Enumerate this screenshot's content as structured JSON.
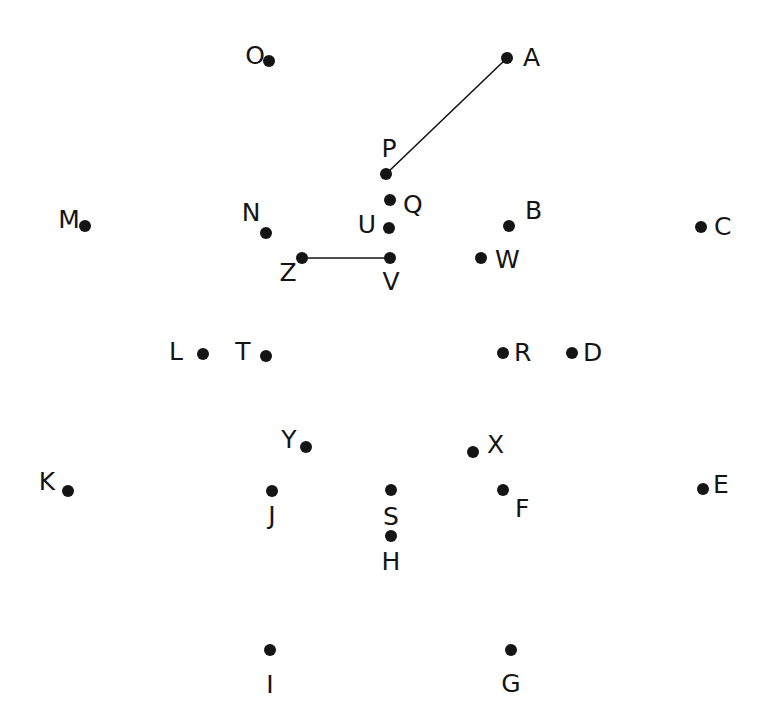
{
  "figure": {
    "type": "node-link-diagram",
    "width": 771,
    "height": 727,
    "background_color": "#ffffff",
    "ink_color": "#141414",
    "dot_radius": 6,
    "label_font_size": 25,
    "edge_stroke_width": 1.6
  },
  "nodes": [
    {
      "id": "A",
      "label": "A",
      "x": 507,
      "y": 58,
      "label_x": 523,
      "label_y": 66,
      "label_anchor": "start"
    },
    {
      "id": "O",
      "label": "O",
      "x": 269,
      "y": 61,
      "label_x": 255,
      "label_y": 64,
      "label_anchor": "middle"
    },
    {
      "id": "P",
      "label": "P",
      "x": 386,
      "y": 174,
      "label_x": 389,
      "label_y": 157,
      "label_anchor": "middle"
    },
    {
      "id": "Q",
      "label": "Q",
      "x": 390,
      "y": 200,
      "label_x": 403,
      "label_y": 213,
      "label_anchor": "start"
    },
    {
      "id": "M",
      "label": "M",
      "x": 85,
      "y": 226,
      "label_x": 69,
      "label_y": 228,
      "label_anchor": "middle"
    },
    {
      "id": "N",
      "label": "N",
      "x": 266,
      "y": 233,
      "label_x": 251,
      "label_y": 221,
      "label_anchor": "middle"
    },
    {
      "id": "U",
      "label": "U",
      "x": 389,
      "y": 228,
      "label_x": 376,
      "label_y": 233,
      "label_anchor": "end"
    },
    {
      "id": "B",
      "label": "B",
      "x": 509,
      "y": 226,
      "label_x": 525,
      "label_y": 219,
      "label_anchor": "start"
    },
    {
      "id": "C",
      "label": "C",
      "x": 701,
      "y": 227,
      "label_x": 714,
      "label_y": 235,
      "label_anchor": "start"
    },
    {
      "id": "W",
      "label": "W",
      "x": 481,
      "y": 258,
      "label_x": 495,
      "label_y": 268,
      "label_anchor": "start"
    },
    {
      "id": "Z",
      "label": "Z",
      "x": 302,
      "y": 258,
      "label_x": 288,
      "label_y": 281,
      "label_anchor": "middle"
    },
    {
      "id": "V",
      "label": "V",
      "x": 390,
      "y": 258,
      "label_x": 391,
      "label_y": 290,
      "label_anchor": "middle"
    },
    {
      "id": "L",
      "label": "L",
      "x": 203,
      "y": 354,
      "label_x": 176,
      "label_y": 360,
      "label_anchor": "middle"
    },
    {
      "id": "T",
      "label": "T",
      "x": 266,
      "y": 356,
      "label_x": 243,
      "label_y": 360,
      "label_anchor": "middle"
    },
    {
      "id": "R",
      "label": "R",
      "x": 503,
      "y": 353,
      "label_x": 514,
      "label_y": 361,
      "label_anchor": "start"
    },
    {
      "id": "D",
      "label": "D",
      "x": 572,
      "y": 353,
      "label_x": 583,
      "label_y": 361,
      "label_anchor": "start"
    },
    {
      "id": "Y",
      "label": "Y",
      "x": 306,
      "y": 447,
      "label_x": 289,
      "label_y": 448,
      "label_anchor": "middle"
    },
    {
      "id": "X",
      "label": "X",
      "x": 473,
      "y": 452,
      "label_x": 487,
      "label_y": 453,
      "label_anchor": "start"
    },
    {
      "id": "K",
      "label": "K",
      "x": 68,
      "y": 491,
      "label_x": 47,
      "label_y": 490,
      "label_anchor": "middle"
    },
    {
      "id": "E",
      "label": "E",
      "x": 703,
      "y": 489,
      "label_x": 713,
      "label_y": 493,
      "label_anchor": "start"
    },
    {
      "id": "J",
      "label": "J",
      "x": 272,
      "y": 491,
      "label_x": 272,
      "label_y": 524,
      "label_anchor": "middle"
    },
    {
      "id": "F",
      "label": "F",
      "x": 503,
      "y": 490,
      "label_x": 515,
      "label_y": 517,
      "label_anchor": "start"
    },
    {
      "id": "S",
      "label": "S",
      "x": 391,
      "y": 490,
      "label_x": 391,
      "label_y": 525,
      "label_anchor": "middle"
    },
    {
      "id": "H",
      "label": "H",
      "x": 391,
      "y": 536,
      "label_x": 391,
      "label_y": 570,
      "label_anchor": "middle"
    },
    {
      "id": "I",
      "label": "I",
      "x": 270,
      "y": 650,
      "label_x": 270,
      "label_y": 693,
      "label_anchor": "middle"
    },
    {
      "id": "G",
      "label": "G",
      "x": 511,
      "y": 650,
      "label_x": 511,
      "label_y": 692,
      "label_anchor": "middle"
    }
  ],
  "edges": [
    {
      "id": "P-A",
      "source": "P",
      "target": "A",
      "x1": 386,
      "y1": 174,
      "x2": 507,
      "y2": 58
    },
    {
      "id": "Z-V",
      "source": "Z",
      "target": "V",
      "x1": 302,
      "y1": 258,
      "x2": 390,
      "y2": 258
    }
  ]
}
